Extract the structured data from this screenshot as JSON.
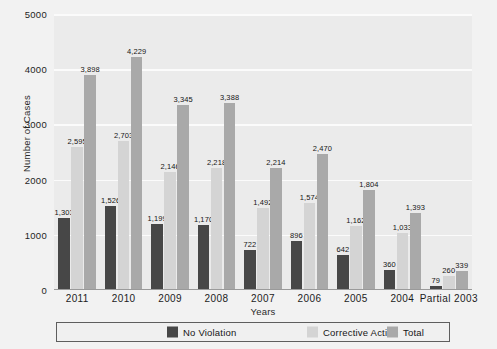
{
  "chart_data": {
    "type": "bar",
    "title": "",
    "xlabel": "Years",
    "ylabel": "Number of Cases",
    "categories": [
      "2011",
      "2010",
      "2009",
      "2008",
      "2007",
      "2006",
      "2005",
      "2004",
      "Partial 2003"
    ],
    "series": [
      {
        "name": "No Violation",
        "color": "#474747",
        "values": [
          1303,
          1526,
          1199,
          1170,
          722,
          896,
          642,
          360,
          79
        ],
        "labels": [
          "1,303",
          "1,526",
          "1,199",
          "1,170",
          "722",
          "896",
          "642",
          "360",
          "79"
        ]
      },
      {
        "name": "Corrective Action",
        "color": "#d4d4d4",
        "values": [
          2595,
          2703,
          2146,
          2218,
          1492,
          1574,
          1162,
          1033,
          260
        ],
        "labels": [
          "2,595",
          "2,703",
          "2,146",
          "2,218",
          "1,492",
          "1,574",
          "1,162",
          "1,033",
          "260"
        ]
      },
      {
        "name": "Total",
        "color": "#a9a9a9",
        "values": [
          3898,
          4229,
          3345,
          3388,
          2214,
          2470,
          1804,
          1393,
          339
        ],
        "labels": [
          "3,898",
          "4,229",
          "3,345",
          "3,388",
          "2,214",
          "2,470",
          "1,804",
          "1,393",
          "339"
        ]
      }
    ],
    "ylim": [
      0,
      5000
    ],
    "yticks": [
      0,
      1000,
      2000,
      3000,
      4000,
      5000
    ],
    "ytick_labels": [
      "0",
      "1000",
      "2000",
      "3000",
      "4000",
      "5000"
    ],
    "grid": "horizontal",
    "legend_position": "bottom",
    "plot_background": "#ebebeb",
    "gridline_color": "#fbfbfb"
  },
  "legend": {
    "items": [
      {
        "label": "No Violation"
      },
      {
        "label": "Corrective Action"
      },
      {
        "label": "Total"
      }
    ]
  }
}
